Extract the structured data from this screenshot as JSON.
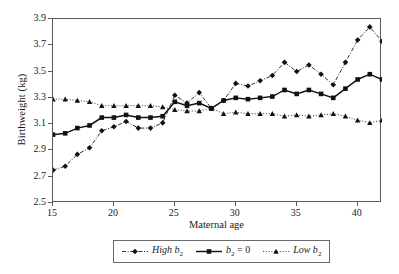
{
  "chart_data": {
    "type": "line",
    "title": "",
    "xlabel": "Maternal age",
    "ylabel": "Birthweight (kg)",
    "xlim": [
      15,
      42
    ],
    "ylim": [
      2.5,
      3.9
    ],
    "xticks": [
      15,
      20,
      25,
      30,
      35,
      40
    ],
    "yticks": [
      2.5,
      2.7,
      2.9,
      3.1,
      3.3,
      3.5,
      3.7,
      3.9
    ],
    "grid": false,
    "legend_position": "below-center",
    "x": [
      15,
      16,
      17,
      18,
      19,
      20,
      21,
      22,
      23,
      24,
      25,
      26,
      27,
      28,
      29,
      30,
      31,
      32,
      33,
      34,
      35,
      36,
      37,
      38,
      39,
      40,
      41,
      42
    ],
    "series": [
      {
        "name": "High b2",
        "label": "High b",
        "sub": "2",
        "marker": "diamond",
        "linestyle": "dash-dot",
        "color": "#111111",
        "values": [
          2.75,
          2.78,
          2.87,
          2.92,
          3.05,
          3.08,
          3.12,
          3.07,
          3.07,
          3.11,
          3.32,
          3.26,
          3.34,
          3.22,
          3.28,
          3.41,
          3.39,
          3.43,
          3.47,
          3.57,
          3.5,
          3.55,
          3.48,
          3.4,
          3.57,
          3.74,
          3.84,
          3.73
        ]
      },
      {
        "name": "b2 = 0",
        "label": "b",
        "sub": "2",
        "suffix": " = 0",
        "marker": "square",
        "linestyle": "solid",
        "color": "#111111",
        "values": [
          3.02,
          3.03,
          3.07,
          3.09,
          3.15,
          3.15,
          3.17,
          3.15,
          3.15,
          3.16,
          3.27,
          3.24,
          3.26,
          3.22,
          3.28,
          3.3,
          3.29,
          3.3,
          3.31,
          3.36,
          3.33,
          3.36,
          3.33,
          3.3,
          3.37,
          3.44,
          3.48,
          3.44
        ]
      },
      {
        "name": "Low b2",
        "label": "Low b",
        "sub": "2",
        "marker": "triangle",
        "linestyle": "dotted",
        "color": "#111111",
        "values": [
          3.29,
          3.29,
          3.28,
          3.27,
          3.24,
          3.24,
          3.24,
          3.24,
          3.24,
          3.23,
          3.21,
          3.2,
          3.2,
          3.22,
          3.18,
          3.19,
          3.18,
          3.18,
          3.18,
          3.16,
          3.17,
          3.16,
          3.17,
          3.18,
          3.16,
          3.13,
          3.11,
          3.13
        ]
      }
    ],
    "legend": [
      {
        "label": "High b",
        "sub": "2",
        "marker": "diamond",
        "linestyle": "dash-dot"
      },
      {
        "label": "b",
        "sub": "2",
        "suffix": " = 0",
        "marker": "square",
        "linestyle": "solid"
      },
      {
        "label": "Low b",
        "sub": "2",
        "marker": "triangle",
        "linestyle": "dotted"
      }
    ]
  },
  "axis": {
    "x_tick_labels": [
      "15",
      "20",
      "25",
      "30",
      "35",
      "40"
    ],
    "y_tick_labels": [
      "2.5",
      "2.7",
      "2.9",
      "3.1",
      "3.3",
      "3.5",
      "3.7",
      "3.9"
    ],
    "x_title": "Maternal age",
    "y_title": "Birthweight (kg)"
  }
}
